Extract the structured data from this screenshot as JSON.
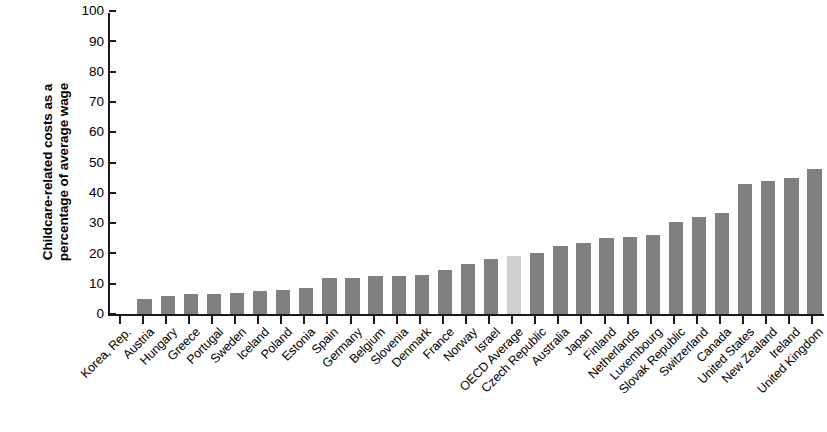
{
  "chart_data": {
    "type": "bar",
    "title": "",
    "subtitle": "",
    "xlabel": "",
    "ylabel": "Childcare-related costs as a percentage of average wage",
    "ylabel_lines": [
      "Childcare-related costs as a",
      "percentage of average wage"
    ],
    "ylim": [
      0,
      100
    ],
    "y_ticks": [
      0,
      10,
      20,
      30,
      40,
      50,
      60,
      70,
      80,
      90,
      100
    ],
    "grid": false,
    "legend": null,
    "bar_color": "#808080",
    "highlight_color": "#cfcfcf",
    "highlight_category": "OECD Average",
    "categories": [
      "Korea, Rep.",
      "Austria",
      "Hungary",
      "Greece",
      "Portugal",
      "Sweden",
      "Iceland",
      "Poland",
      "Estonia",
      "Spain",
      "Germany",
      "Belgium",
      "Slovenia",
      "Denmark",
      "France",
      "Norway",
      "Israel",
      "OECD Average",
      "Czech Republic",
      "Australia",
      "Japan",
      "Finland",
      "Netherlands",
      "Luxembourg",
      "Slovak Republic",
      "Switzerland",
      "Canada",
      "United States",
      "New Zealand",
      "Ireland",
      "United Kingdom"
    ],
    "values": [
      0,
      5,
      6,
      6.5,
      6.5,
      7,
      7.5,
      8,
      8.5,
      12,
      12,
      12.5,
      12.5,
      13,
      14.5,
      16.5,
      18,
      19,
      20,
      22.5,
      23.5,
      25,
      25.5,
      26,
      30.5,
      32,
      33.5,
      43,
      44,
      45,
      48
    ]
  }
}
